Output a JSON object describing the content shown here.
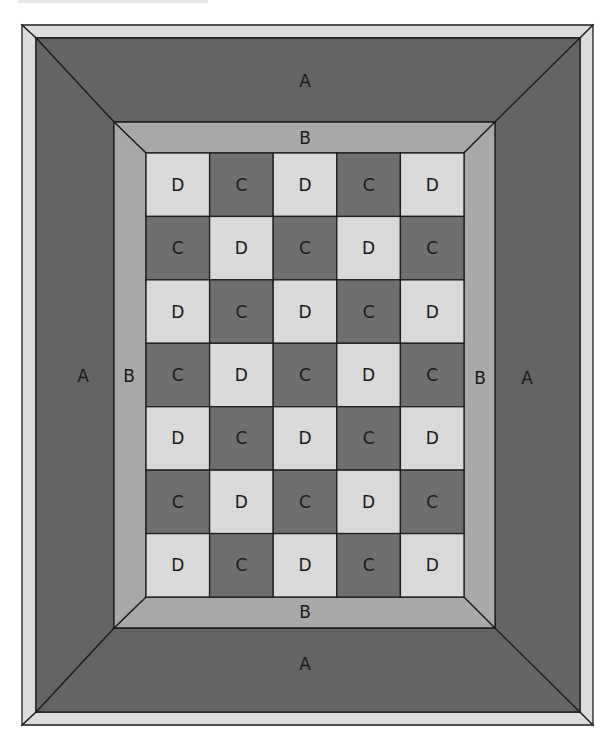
{
  "diagram": {
    "colors": {
      "outer_frame": "#dcdcdc",
      "border_a": "#646464",
      "border_b": "#a9a9a9",
      "block_c": "#6f6f6f",
      "block_d": "#d9d9d9",
      "outline": "#1e1e1e"
    },
    "border_a": {
      "top_label": "A",
      "bottom_label": "A",
      "left_label": "A",
      "right_label": "A"
    },
    "border_b": {
      "top_label": "B",
      "bottom_label": "B",
      "left_label": "B",
      "right_label": "B"
    },
    "grid": {
      "columns": 5,
      "rows": 7,
      "cells": [
        [
          "D",
          "C",
          "D",
          "C",
          "D"
        ],
        [
          "C",
          "D",
          "C",
          "D",
          "C"
        ],
        [
          "D",
          "C",
          "D",
          "C",
          "D"
        ],
        [
          "C",
          "D",
          "C",
          "D",
          "C"
        ],
        [
          "D",
          "C",
          "D",
          "C",
          "D"
        ],
        [
          "C",
          "D",
          "C",
          "D",
          "C"
        ],
        [
          "D",
          "C",
          "D",
          "C",
          "D"
        ]
      ]
    }
  }
}
